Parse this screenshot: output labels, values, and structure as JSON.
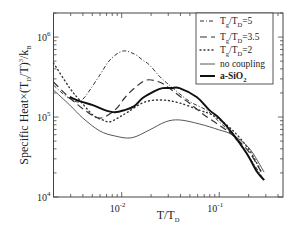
{
  "chart_data": {
    "type": "line",
    "title": "",
    "xlabel": "T/T_D",
    "ylabel": "Specific Heat×(T_D/T)^3/k_B",
    "xscale": "log",
    "yscale": "log",
    "xlim": [
      0.002,
      0.45
    ],
    "ylim": [
      10000,
      2000000
    ],
    "grid": false,
    "legend_position": "top-right",
    "x_ticks": [
      {
        "value": 0.01,
        "base": "10",
        "exp": "-2"
      },
      {
        "value": 0.1,
        "base": "10",
        "exp": "-1"
      }
    ],
    "y_ticks": [
      {
        "value": 10000,
        "base": "10",
        "exp": "4"
      },
      {
        "value": 100000,
        "base": "10",
        "exp": "5"
      },
      {
        "value": 1000000,
        "base": "10",
        "exp": "6"
      }
    ],
    "series": [
      {
        "name": "Tg/TD=5",
        "legend": {
          "main": "T",
          "sub1": "g",
          "mid": "/T",
          "sub2": "D",
          "tail": "=5"
        },
        "style": "dashdot",
        "color": "#333333",
        "points": [
          [
            0.002,
            251000
          ],
          [
            0.00268,
            183000
          ],
          [
            0.00356,
            154000
          ],
          [
            0.0041,
            173000
          ],
          [
            0.00472,
            218000
          ],
          [
            0.00597,
            335000
          ],
          [
            0.00756,
            516000
          ],
          [
            0.0102,
            668000
          ],
          [
            0.0135,
            613000
          ],
          [
            0.0164,
            516000
          ],
          [
            0.0193,
            447000
          ],
          [
            0.0243,
            325000
          ],
          [
            0.0307,
            251000
          ],
          [
            0.0492,
            158000
          ],
          [
            0.0735,
            122000
          ],
          [
            0.1,
            87000
          ],
          [
            0.136,
            60000
          ],
          [
            0.202,
            31600
          ],
          [
            0.288,
            16300
          ]
        ]
      },
      {
        "name": "Tg/TD=3.5",
        "legend": {
          "main": "T",
          "sub1": "g",
          "mid": "/T",
          "sub2": "D",
          "tail": "=3.5"
        },
        "style": "dashed",
        "color": "#333333",
        "points": [
          [
            0.002,
            274000
          ],
          [
            0.00294,
            173000
          ],
          [
            0.00419,
            122000
          ],
          [
            0.00597,
            97000
          ],
          [
            0.0085,
            122000
          ],
          [
            0.0107,
            173000
          ],
          [
            0.0135,
            230000
          ],
          [
            0.0179,
            290000
          ],
          [
            0.0243,
            274000
          ],
          [
            0.0307,
            230000
          ],
          [
            0.0391,
            183000
          ],
          [
            0.0492,
            150000
          ],
          [
            0.07,
            106000
          ],
          [
            0.1,
            79000
          ],
          [
            0.136,
            60000
          ],
          [
            0.202,
            36500
          ],
          [
            0.27,
            20500
          ]
        ]
      },
      {
        "name": "Tg/TD=2",
        "legend": {
          "main": "T",
          "sub1": "g",
          "mid": "/T",
          "sub2": "D",
          "tail": "=2"
        },
        "style": "dotted",
        "color": "#333333",
        "points": [
          [
            0.002,
            473000
          ],
          [
            0.00294,
            230000
          ],
          [
            0.0037,
            163000
          ],
          [
            0.00506,
            106000
          ],
          [
            0.00639,
            92000
          ],
          [
            0.0075,
            87000
          ],
          [
            0.0091,
            97000
          ],
          [
            0.0115,
            115000
          ],
          [
            0.0172,
            154000
          ],
          [
            0.0262,
            163000
          ],
          [
            0.0391,
            150000
          ],
          [
            0.0625,
            122000
          ],
          [
            0.0886,
            103000
          ],
          [
            0.136,
            69000
          ],
          [
            0.202,
            39000
          ],
          [
            0.27,
            20500
          ]
        ]
      },
      {
        "name": "no coupling",
        "legend": {
          "main": "no coupling",
          "sub1": "",
          "mid": "",
          "sub2": "",
          "tail": ""
        },
        "style": "thin",
        "color": "#444444",
        "points": [
          [
            0.002,
            218000
          ],
          [
            0.00294,
            141000
          ],
          [
            0.004,
            97000
          ],
          [
            0.00597,
            67000
          ],
          [
            0.0085,
            58000
          ],
          [
            0.01265,
            55000
          ],
          [
            0.0193,
            69000
          ],
          [
            0.0281,
            87000
          ],
          [
            0.0391,
            92000
          ],
          [
            0.0625,
            82000
          ],
          [
            0.1,
            69000
          ],
          [
            0.136,
            60000
          ],
          [
            0.202,
            41000
          ],
          [
            0.288,
            20500
          ]
        ]
      },
      {
        "name": "a-SiO2",
        "legend": {
          "main": "a-SiO",
          "sub1": "",
          "mid": "",
          "sub2": "2",
          "tail": ""
        },
        "style": "thick",
        "color": "#111111",
        "points": [
          [
            0.00294,
            178000
          ],
          [
            0.0037,
            158000
          ],
          [
            0.00506,
            141000
          ],
          [
            0.00672,
            122000
          ],
          [
            0.0085,
            115000
          ],
          [
            0.0107,
            122000
          ],
          [
            0.0135,
            137000
          ],
          [
            0.0164,
            173000
          ],
          [
            0.0217,
            211000
          ],
          [
            0.0262,
            230000
          ],
          [
            0.0324,
            230000
          ],
          [
            0.0391,
            230000
          ],
          [
            0.0586,
            178000
          ],
          [
            0.0791,
            122000
          ],
          [
            0.1,
            97000
          ],
          [
            0.136,
            63000
          ],
          [
            0.19,
            35500
          ],
          [
            0.245,
            20500
          ],
          [
            0.288,
            16300
          ]
        ]
      }
    ]
  }
}
